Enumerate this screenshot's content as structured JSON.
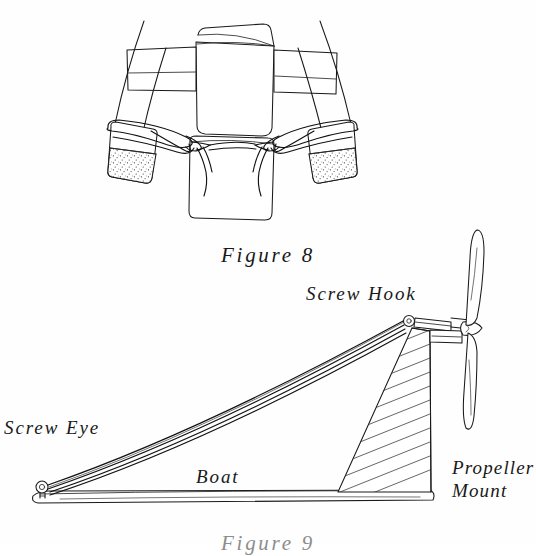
{
  "page": {
    "background": "#ffffff",
    "ink_color": "#1a1a1a",
    "width": 536,
    "height": 545
  },
  "figures": [
    {
      "id": "figure-8",
      "caption": "Figure 8",
      "description": "Top-down view of a twin-outrigger (catamaran) boat body with two sponge blocks lashed to the hulls by rubber bands",
      "parts": [
        "center-hull",
        "left-outrigger",
        "right-outrigger",
        "left-sponge-block",
        "right-sponge-block",
        "rubber-band-loops",
        "cross-spar-left",
        "cross-spar-right"
      ]
    },
    {
      "id": "figure-9",
      "caption": "Figure 9",
      "description": "Side view of the rubber-band powered boat showing the drive band running from a screw eye at the bow to a screw hook on the propeller mount at the stern",
      "labels": [
        {
          "name": "screw-hook",
          "text": "Screw Hook"
        },
        {
          "name": "screw-eye",
          "text": "Screw Eye"
        },
        {
          "name": "boat",
          "text": "Boat"
        },
        {
          "name": "propeller-mount",
          "text": "Propeller\nMount"
        }
      ],
      "parts": [
        "boat-hull",
        "rubber-band-strands",
        "screw-eye",
        "screw-hook",
        "propeller-mount-block",
        "propeller-shaft",
        "propeller-blade-upper",
        "propeller-blade-lower",
        "propeller-hub"
      ]
    }
  ]
}
